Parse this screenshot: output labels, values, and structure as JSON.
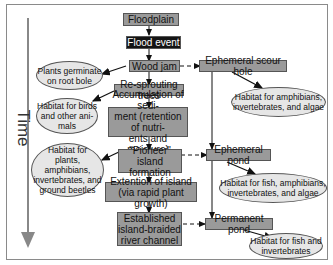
{
  "axis": {
    "label": "Time"
  },
  "main_chain": [
    {
      "id": "floodplain",
      "label": "Floodplain"
    },
    {
      "id": "flood_event",
      "label": "Flood event"
    },
    {
      "id": "wood_jam",
      "label": "Wood jam"
    },
    {
      "id": "resprouting",
      "label": "Re-sprouting trees"
    },
    {
      "id": "accumulation",
      "label": "Accumulation of sedi-\nment (retention of nutri-\nents and moisture)"
    },
    {
      "id": "pioneer",
      "label": "\"Pioneer\" island\nformation"
    },
    {
      "id": "extension",
      "label": "Extention of island\n(via rapid plant growth)"
    },
    {
      "id": "established",
      "label": "Established\nisland-braided\nriver channel"
    }
  ],
  "side_chain": [
    {
      "id": "scour_hole",
      "label": "Ephemeral scour hole"
    },
    {
      "id": "ephemeral_pond",
      "label": "Ephemeral pond"
    },
    {
      "id": "permanent_pond",
      "label": "Permanent pond"
    }
  ],
  "left_habitats": [
    {
      "id": "germinate",
      "label": "Plants germinate\non root bole"
    },
    {
      "id": "birds",
      "label": "Habitat for birds\nand other ani-\nmals"
    },
    {
      "id": "plants_amph",
      "label": "Habitat for\nplants, amphibians,\ninvertebrates, and\nground beetles"
    }
  ],
  "right_habitats": [
    {
      "id": "amph_alg",
      "label": "Habitat for amphibians,\ninvertebrates, and algae"
    },
    {
      "id": "fish_amph",
      "label": "Habitat for fish, amphibians,\ninvertebrates, and algae"
    },
    {
      "id": "fish_inv",
      "label": "Habitat for fish and\ninvertebrates"
    }
  ],
  "colors": {
    "box": "#9a9a9a",
    "dark_box": "#141414",
    "ellipse": "#e6e6e6",
    "line": "#111111"
  }
}
